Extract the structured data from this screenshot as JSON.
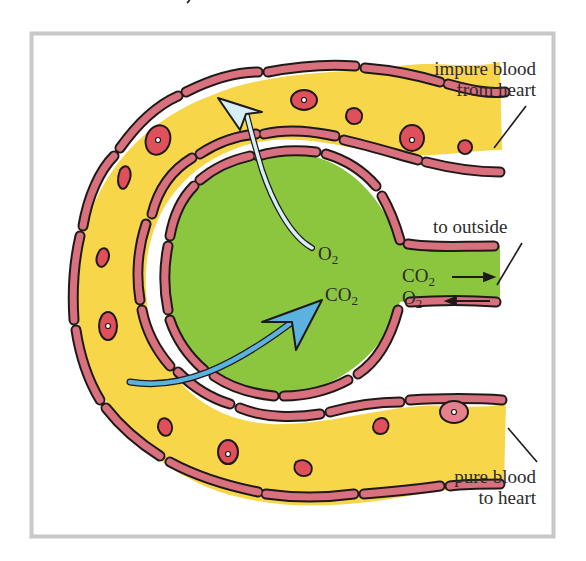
{
  "diagram": {
    "frame": {
      "border_color": "#c8c8c8",
      "background": "#ffffff"
    },
    "colors": {
      "alveolus_fill": "#8cc63f",
      "capillary_fill": "#f7d64a",
      "wall_cell_fill": "#d9707e",
      "red_cell_fill": "#e0505a",
      "outline": "#1f1a1a",
      "o2_arrow": "#d6eef6",
      "co2_arrow": "#5bb2de",
      "label_text": "#2b2b2b"
    },
    "labels": {
      "impure_line1": "impure blood",
      "impure_line2": "from heart",
      "to_outside": "to outside",
      "pure_line1": "pure blood",
      "pure_line2": "to heart"
    },
    "gases": {
      "o2_inner": {
        "base": "O",
        "sub": "2"
      },
      "co2_inner": {
        "base": "CO",
        "sub": "2"
      },
      "co2_out": {
        "base": "CO",
        "sub": "2",
        "arrow": "right"
      },
      "o2_in": {
        "base": "O",
        "sub": "2",
        "arrow": "left"
      }
    },
    "arrows": [
      {
        "name": "oxygen-diffusion-arrow",
        "from": "alveolus",
        "to": "capillary",
        "gas": "O2"
      },
      {
        "name": "carbon-dioxide-diffusion-arrow",
        "from": "capillary",
        "to": "alveolus",
        "gas": "CO2"
      }
    ]
  }
}
